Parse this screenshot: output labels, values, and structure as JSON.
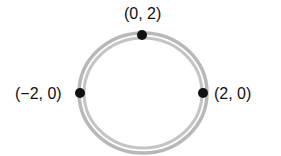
{
  "diagram": {
    "shape": "circle",
    "center": [
      0,
      0
    ],
    "radius": 2,
    "points": [
      {
        "label": "(0, 2)",
        "x": 0,
        "y": 2
      },
      {
        "label": "(−2, 0)",
        "x": -2,
        "y": 0
      },
      {
        "label": "(2, 0)",
        "x": 2,
        "y": 0
      }
    ],
    "colors": {
      "ring": "#b8b8b8",
      "point": "#111111",
      "text": "#111111"
    }
  }
}
